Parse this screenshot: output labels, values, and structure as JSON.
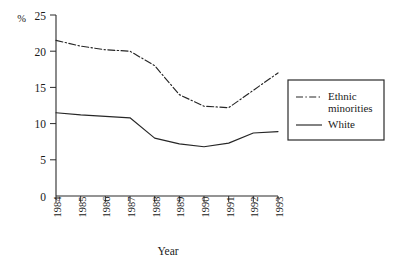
{
  "chart_data": {
    "type": "line",
    "title": "",
    "xlabel": "Year",
    "ylabel": "%",
    "categories": [
      "1984",
      "1985",
      "1986",
      "1987",
      "1988",
      "1989",
      "1990",
      "1991",
      "1992",
      "1993"
    ],
    "x": [
      1984,
      1985,
      1986,
      1987,
      1988,
      1989,
      1990,
      1991,
      1992,
      1993
    ],
    "ylim": [
      0,
      25
    ],
    "yticks": [
      0,
      5,
      10,
      15,
      20,
      25
    ],
    "ytick_labels": [
      "0",
      "5",
      "10",
      "15",
      "20",
      "25"
    ],
    "grid": false,
    "legend_position": "right",
    "series": [
      {
        "name": "Ethnic minorities",
        "style": "dash-dot",
        "color": "#262626",
        "values": [
          21.5,
          20.7,
          20.2,
          20.0,
          18.0,
          14.0,
          12.4,
          12.2,
          14.6,
          17.0
        ]
      },
      {
        "name": "White",
        "style": "solid",
        "color": "#262626",
        "values": [
          11.5,
          11.2,
          11.0,
          10.8,
          8.0,
          7.2,
          6.8,
          7.3,
          8.7,
          8.9
        ]
      }
    ]
  },
  "axes": {
    "y_unit_label": "%",
    "x_axis_title": "Year"
  },
  "legend": {
    "entries": [
      {
        "label_line1": "Ethnic",
        "label_line2": "minorities",
        "style": "dash-dot"
      },
      {
        "label_line1": "White",
        "label_line2": "",
        "style": "solid"
      }
    ]
  }
}
